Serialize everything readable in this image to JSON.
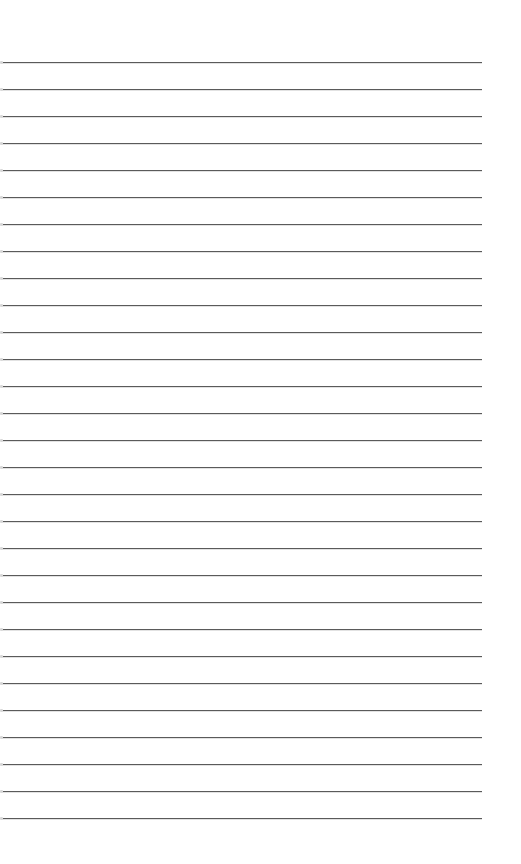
{
  "page": {
    "type": "lined-paper",
    "background_color": "#ffffff",
    "line_color": "#5a5a5a",
    "line_count": 29,
    "first_line_y": 62,
    "line_spacing": 27,
    "line_left_x": 2,
    "line_right_x": 482
  }
}
